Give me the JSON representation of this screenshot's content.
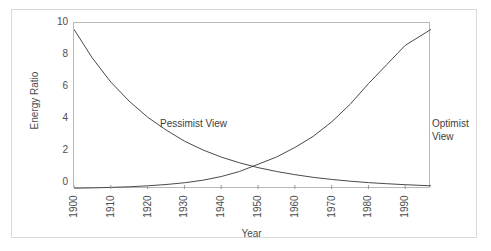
{
  "chart_data": {
    "type": "line",
    "title": "",
    "xlabel": "Year",
    "ylabel": "Energy Ratio",
    "xlim": [
      1900,
      1997
    ],
    "ylim": [
      0,
      10.4
    ],
    "xticks": [
      1900,
      1910,
      1920,
      1930,
      1940,
      1950,
      1960,
      1970,
      1980,
      1990
    ],
    "xticklabels": [
      "1900",
      "1910",
      "1920",
      "1930",
      "1940",
      "1950",
      "1960",
      "1970",
      "1980",
      "1990"
    ],
    "yticks": [
      0,
      2,
      4,
      6,
      8,
      10
    ],
    "yticklabels": [
      "0",
      "2",
      "4",
      "6",
      "8",
      "10"
    ],
    "grid": false,
    "legend": "none",
    "line_color": "#4a4a4a",
    "x": [
      1900,
      1905,
      1910,
      1915,
      1920,
      1925,
      1930,
      1935,
      1940,
      1945,
      1950,
      1955,
      1960,
      1965,
      1970,
      1975,
      1980,
      1985,
      1990,
      1997
    ],
    "series": [
      {
        "name": "Pessimist View",
        "values": [
          10.0,
          8.2,
          6.7,
          5.5,
          4.5,
          3.7,
          3.0,
          2.45,
          2.0,
          1.64,
          1.34,
          1.1,
          0.9,
          0.73,
          0.6,
          0.49,
          0.4,
          0.33,
          0.27,
          0.2
        ]
      },
      {
        "name": "Optimist View",
        "values": [
          0.05,
          0.07,
          0.1,
          0.14,
          0.2,
          0.28,
          0.39,
          0.55,
          0.78,
          1.1,
          1.55,
          2.0,
          2.6,
          3.3,
          4.2,
          5.3,
          6.6,
          7.8,
          9.0,
          10.0
        ]
      }
    ],
    "annotations": [
      {
        "text": "Pessimist  View",
        "x_year": 1905,
        "y_value": 5.4
      },
      {
        "text": "Optimist\nView",
        "x_year": 1978,
        "y_value": 5.4
      }
    ],
    "crossing": {
      "x_year": 1947,
      "y_value": 1.5
    }
  },
  "axes": {
    "x_title": "Year",
    "y_title": "Energy Ratio"
  }
}
